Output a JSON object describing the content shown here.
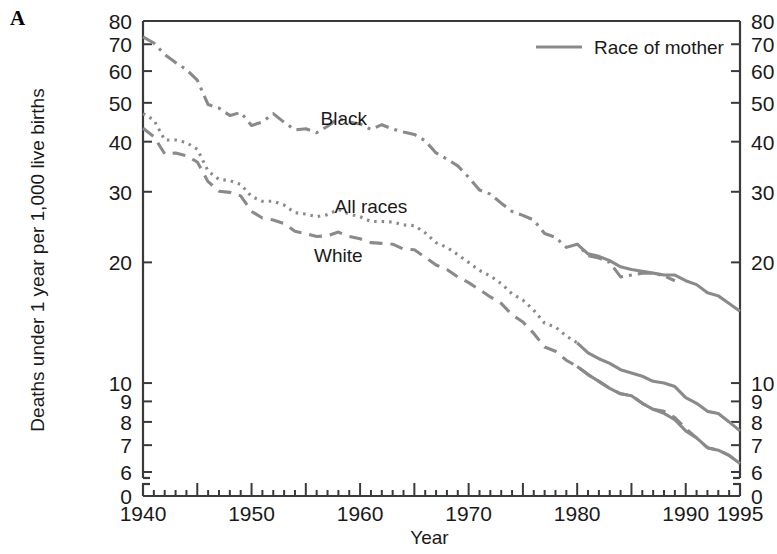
{
  "figure": {
    "panel_label": "A",
    "background": "#ffffff",
    "line_color": "#8a8a8a",
    "axis_color": "#3a3a3a",
    "text_color": "#1a1a1a"
  },
  "chart_data": {
    "type": "line",
    "title": "",
    "xlabel": "Year",
    "ylabel": "Deaths under 1 year per 1,000 live births",
    "yscale": "log",
    "ylim": [
      5.6,
      80
    ],
    "xlim": [
      1940,
      1995
    ],
    "grid": false,
    "axis_break_below": 6,
    "y_ticks": [
      80,
      70,
      60,
      50,
      40,
      30,
      20,
      10,
      9,
      8,
      7,
      6,
      0
    ],
    "y_tick_labels": [
      "80",
      "70",
      "60",
      "50",
      "40",
      "30",
      "20",
      "10",
      "9",
      "8",
      "7",
      "6",
      "0"
    ],
    "y_ticks_right": [
      80,
      70,
      60,
      50,
      40,
      30,
      20,
      10,
      9,
      8,
      7,
      6,
      0
    ],
    "y_tick_labels_right": [
      "80",
      "70",
      "60",
      "50",
      "40",
      "30",
      "20",
      "10",
      "9",
      "8",
      "7",
      "6",
      "0"
    ],
    "x_ticks_major": [
      1940,
      1950,
      1960,
      1970,
      1980,
      1990,
      1995
    ],
    "x_tick_labels": [
      "1940",
      "1950",
      "1960",
      "1970",
      "1980",
      "1990",
      "1995"
    ],
    "x_ticks_minor_step": 1,
    "legend": {
      "position": "top-right",
      "entries": [
        {
          "label": "Race of mother",
          "style": "solid"
        }
      ]
    },
    "annotations": [
      {
        "text": "Black",
        "x": 1958.5,
        "y": 44.0
      },
      {
        "text": "All races",
        "x": 1961.0,
        "y": 26.5
      },
      {
        "text": "White",
        "x": 1958.0,
        "y": 20.0
      }
    ],
    "series": [
      {
        "name": "Black",
        "style": "dashdot",
        "note": "race of child (1940-1989)",
        "x": [
          1940,
          1941,
          1942,
          1943,
          1944,
          1945,
          1946,
          1947,
          1948,
          1949,
          1950,
          1951,
          1952,
          1953,
          1954,
          1955,
          1956,
          1957,
          1958,
          1959,
          1960,
          1961,
          1962,
          1963,
          1964,
          1965,
          1966,
          1967,
          1968,
          1969,
          1970,
          1971,
          1972,
          1973,
          1974,
          1975,
          1976,
          1977,
          1978,
          1979,
          1980,
          1981,
          1982,
          1983,
          1984,
          1985,
          1986,
          1987,
          1988,
          1989
        ],
        "y": [
          73.0,
          70.5,
          66.0,
          63.0,
          60.5,
          57.0,
          49.5,
          48.5,
          46.5,
          47.3,
          43.9,
          44.8,
          47.0,
          44.7,
          42.8,
          43.1,
          42.1,
          43.7,
          45.7,
          44.8,
          44.3,
          42.9,
          44.1,
          43.0,
          42.3,
          41.7,
          40.2,
          37.5,
          36.2,
          34.8,
          32.6,
          30.3,
          29.6,
          28.1,
          26.8,
          26.2,
          25.5,
          23.6,
          23.1,
          21.8,
          22.2,
          20.8,
          20.5,
          20.0,
          18.4,
          18.6,
          18.8,
          18.8,
          18.5,
          18.0
        ]
      },
      {
        "name": "Black (race of mother)",
        "style": "solid",
        "note": "1980-1995",
        "x": [
          1980,
          1981,
          1982,
          1983,
          1984,
          1985,
          1986,
          1987,
          1988,
          1989,
          1990,
          1991,
          1992,
          1993,
          1994,
          1995
        ],
        "y": [
          22.2,
          21.0,
          20.7,
          20.2,
          19.5,
          19.2,
          19.0,
          18.8,
          18.6,
          18.6,
          18.0,
          17.6,
          16.8,
          16.5,
          15.8,
          15.1
        ]
      },
      {
        "name": "All races",
        "style": "dotted",
        "note": "1940-1980",
        "x": [
          1940,
          1941,
          1942,
          1943,
          1944,
          1945,
          1946,
          1947,
          1948,
          1949,
          1950,
          1951,
          1952,
          1953,
          1954,
          1955,
          1956,
          1957,
          1958,
          1959,
          1960,
          1961,
          1962,
          1963,
          1964,
          1965,
          1966,
          1967,
          1968,
          1969,
          1970,
          1971,
          1972,
          1973,
          1974,
          1975,
          1976,
          1977,
          1978,
          1979,
          1980
        ],
        "y": [
          47.0,
          45.3,
          40.4,
          40.4,
          39.8,
          38.3,
          33.8,
          32.2,
          32.0,
          31.3,
          29.2,
          28.4,
          28.4,
          27.8,
          26.6,
          26.4,
          26.0,
          26.3,
          27.1,
          26.4,
          26.0,
          25.3,
          25.3,
          25.2,
          24.8,
          24.7,
          23.7,
          22.4,
          21.8,
          20.9,
          20.0,
          19.1,
          18.5,
          17.7,
          16.7,
          16.1,
          15.2,
          14.1,
          13.8,
          13.1,
          12.6
        ]
      },
      {
        "name": "All races (race of mother)",
        "style": "solid",
        "note": "1980-1995",
        "x": [
          1980,
          1981,
          1982,
          1983,
          1984,
          1985,
          1986,
          1987,
          1988,
          1989,
          1990,
          1991,
          1992,
          1993,
          1994,
          1995
        ],
        "y": [
          12.6,
          11.9,
          11.5,
          11.2,
          10.8,
          10.6,
          10.4,
          10.1,
          10.0,
          9.8,
          9.2,
          8.9,
          8.5,
          8.4,
          8.0,
          7.6
        ]
      },
      {
        "name": "White",
        "style": "dashed",
        "note": "1940-1995",
        "x": [
          1940,
          1941,
          1942,
          1943,
          1944,
          1945,
          1946,
          1947,
          1948,
          1949,
          1950,
          1951,
          1952,
          1953,
          1954,
          1955,
          1956,
          1957,
          1958,
          1959,
          1960,
          1961,
          1962,
          1963,
          1964,
          1965,
          1966,
          1967,
          1968,
          1969,
          1970,
          1971,
          1972,
          1973,
          1974,
          1975,
          1976,
          1977,
          1978,
          1979,
          1980,
          1981,
          1982,
          1983,
          1984,
          1985,
          1986,
          1987,
          1988,
          1989,
          1990,
          1991,
          1992,
          1993,
          1994,
          1995
        ],
        "y": [
          43.2,
          41.2,
          37.3,
          37.5,
          36.9,
          35.6,
          31.8,
          30.1,
          29.9,
          29.3,
          26.8,
          25.8,
          25.5,
          25.0,
          23.9,
          23.6,
          23.2,
          23.3,
          23.8,
          23.2,
          22.9,
          22.4,
          22.3,
          22.2,
          21.6,
          21.5,
          20.6,
          19.7,
          19.2,
          18.4,
          17.8,
          17.1,
          16.4,
          15.8,
          14.8,
          14.2,
          13.3,
          12.3,
          12.0,
          11.4,
          11.0,
          10.5,
          10.1,
          9.7,
          9.4,
          9.3,
          8.9,
          8.6,
          8.5,
          8.2,
          7.7,
          7.3,
          6.9,
          6.8,
          6.6,
          6.3
        ]
      },
      {
        "name": "White (race of mother)",
        "style": "solid",
        "note": "1980-1995",
        "x": [
          1980,
          1981,
          1982,
          1983,
          1984,
          1985,
          1986,
          1987,
          1988,
          1989,
          1990,
          1991,
          1992,
          1993,
          1994,
          1995
        ],
        "y": [
          11.0,
          10.5,
          10.1,
          9.7,
          9.4,
          9.3,
          8.9,
          8.6,
          8.4,
          8.1,
          7.6,
          7.3,
          6.9,
          6.8,
          6.6,
          6.3
        ]
      }
    ]
  }
}
